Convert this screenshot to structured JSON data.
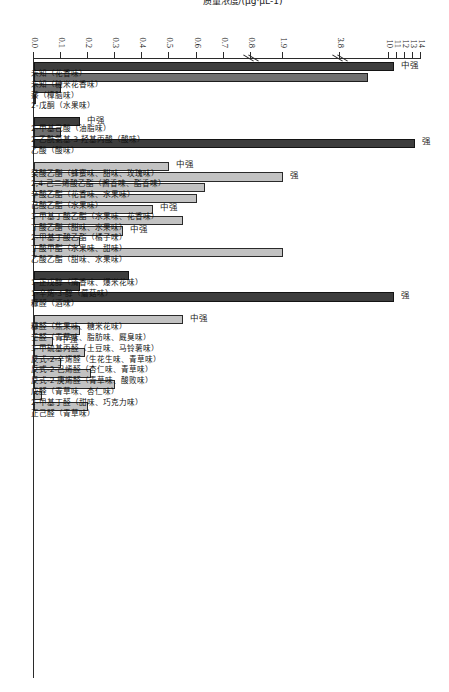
{
  "figure": {
    "orientation": "rotated-90",
    "axis_title": "质量浓度/(μg·μL-1)",
    "colors": {
      "dark": "#3d3d3d",
      "mid": "#6f6f6f",
      "light": "#c2c2c2",
      "axis": "#2b2b2b"
    }
  },
  "chart_data": {
    "type": "bar",
    "title": "",
    "xlabel": "",
    "ylabel": "质量浓度/(μg·μL-1)",
    "orientation": "vertical-bars-rotated",
    "axis_breaks": [
      0.8,
      3.8
    ],
    "tick_labels": [
      "0.0",
      "0.1",
      "0.2",
      "0.3",
      "0.4",
      "0.5",
      "0.6",
      "0.7",
      "0.8",
      "1.9",
      "3.8",
      "10",
      "11",
      "12",
      "13",
      "14"
    ],
    "tick_values": [
      0.0,
      0.1,
      0.2,
      0.3,
      0.4,
      0.5,
      0.6,
      0.7,
      0.8,
      1.9,
      3.8,
      10,
      11,
      12,
      13,
      14
    ],
    "ylim": [
      0.0,
      14
    ],
    "grid": false,
    "legend": [],
    "groups": [
      {
        "name": "group-1",
        "categories": [
          {
            "label": "未知（花香味）",
            "value": 10.6,
            "shade": "dark",
            "note": "中强"
          },
          {
            "label": "未知（糖米花香味）",
            "value": 7.3,
            "shade": "mid",
            "note": ""
          },
          {
            "label": "萘（樟脑味）",
            "value": 0.1,
            "shade": "mid",
            "note": ""
          },
          {
            "label": "2-戊酮（水果味）",
            "value": 0.0,
            "shade": "light",
            "note": ""
          }
        ]
      },
      {
        "name": "group-2",
        "categories": [
          {
            "label": "2-甲基己酸（油脂味）",
            "value": 0.17,
            "shade": "dark",
            "note": "中强"
          },
          {
            "label": "2-乙酰氨基-3-羟基丙酸（酸味）",
            "value": 0.1,
            "shade": "mid",
            "note": ""
          },
          {
            "label": "乙酸（酸味）",
            "value": 13.3,
            "shade": "dark",
            "note": "强"
          }
        ]
      },
      {
        "name": "group-3",
        "categories": [
          {
            "label": "癸酸乙酯（蜂蜜味、甜味、玫瑰味）",
            "value": 0.5,
            "shade": "light",
            "note": "中强"
          },
          {
            "label": "2,4-己二烯酸乙酯（酱香味、酯香味）",
            "value": 1.9,
            "shade": "light",
            "note": "强"
          },
          {
            "label": "辛酸乙酯（花香味、水果味）",
            "value": 0.63,
            "shade": "light",
            "note": ""
          },
          {
            "label": "己酸乙酯（水果味）",
            "value": 0.6,
            "shade": "light",
            "note": ""
          },
          {
            "label": "3-甲基丁酸乙酯（水果味、花香味）",
            "value": 0.44,
            "shade": "light",
            "note": "中强"
          },
          {
            "label": "丁酸乙酯（甜味、水果味）",
            "value": 0.55,
            "shade": "light",
            "note": ""
          },
          {
            "label": "2-甲基丁酸乙酯（橘子味）",
            "value": 0.33,
            "shade": "light",
            "note": "中强"
          },
          {
            "label": "丁酸甲酯（水果味、甜味）",
            "value": 0.17,
            "shade": "light",
            "note": ""
          },
          {
            "label": "乙酸乙酯（甜味、水果味）",
            "value": 1.9,
            "shade": "light",
            "note": ""
          }
        ]
      },
      {
        "name": "group-4",
        "categories": [
          {
            "label": "1-正戊醇（清香味、爆米花味）",
            "value": 0.35,
            "shade": "dark",
            "note": ""
          },
          {
            "label": "1-辛烯-3-醇（蘑菇味）",
            "value": 0.17,
            "shade": "dark",
            "note": ""
          },
          {
            "label": "糠醛（酒味）",
            "value": 10.6,
            "shade": "dark",
            "note": "强"
          }
        ]
      },
      {
        "name": "group-5",
        "categories": [
          {
            "label": "糠醛（焦果味、糖米花味）",
            "value": 0.55,
            "shade": "light",
            "note": "中强"
          },
          {
            "label": "壬醛（青草味、脂肪味、厩臭味）",
            "value": 0.17,
            "shade": "light",
            "note": ""
          },
          {
            "label": "3-甲硫基丙醛（土豆味、马铃薯味）",
            "value": 0.07,
            "shade": "light",
            "note": "中强"
          },
          {
            "label": "反式-2-辛烯醛（生花生味、青草味）",
            "value": 0.19,
            "shade": "light",
            "note": ""
          },
          {
            "label": "反式-2-己烯醛（杏仁味、青草味）",
            "value": 0.1,
            "shade": "light",
            "note": ""
          },
          {
            "label": "反式-2-庚烯醛（青草味、酸败味）",
            "value": 0.21,
            "shade": "light",
            "note": ""
          },
          {
            "label": "戊醛（青草味、杏仁味）",
            "value": 0.3,
            "shade": "light",
            "note": ""
          },
          {
            "label": "2-甲基丁醛（甜味、巧克力味）",
            "value": 0.03,
            "shade": "light",
            "note": ""
          },
          {
            "label": "正己醛（青草味）",
            "value": 0.2,
            "shade": "light",
            "note": ""
          }
        ]
      }
    ]
  }
}
